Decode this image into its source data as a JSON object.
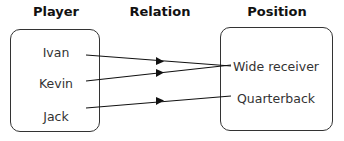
{
  "headers": {
    "player": "Player",
    "relation": "Relation",
    "position": "Position"
  },
  "players": [
    {
      "label": "Ivan"
    },
    {
      "label": "Kevin"
    },
    {
      "label": "Jack"
    }
  ],
  "positions": [
    {
      "label": "Wide receiver"
    },
    {
      "label": "Quarterback"
    }
  ],
  "relations": [
    {
      "from": "Ivan",
      "to": "Wide receiver"
    },
    {
      "from": "Kevin",
      "to": "Wide receiver"
    },
    {
      "from": "Jack",
      "to": "Quarterback"
    }
  ]
}
